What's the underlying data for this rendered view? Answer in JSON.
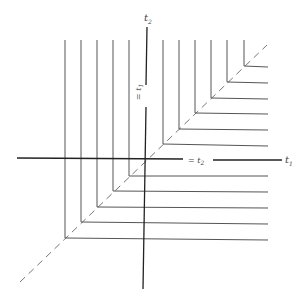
{
  "diagram": {
    "axes": {
      "horizontal_label": "t",
      "horizontal_sub": "1",
      "vertical_label": "t",
      "vertical_sub": "2"
    },
    "annotations": {
      "vertical_eq": "= t",
      "vertical_eq_sub": "1",
      "horizontal_eq": "= t",
      "horizontal_eq_sub": "2"
    },
    "colors": {
      "line": "#555555",
      "axis": "#222222",
      "dash": "#666666"
    }
  }
}
